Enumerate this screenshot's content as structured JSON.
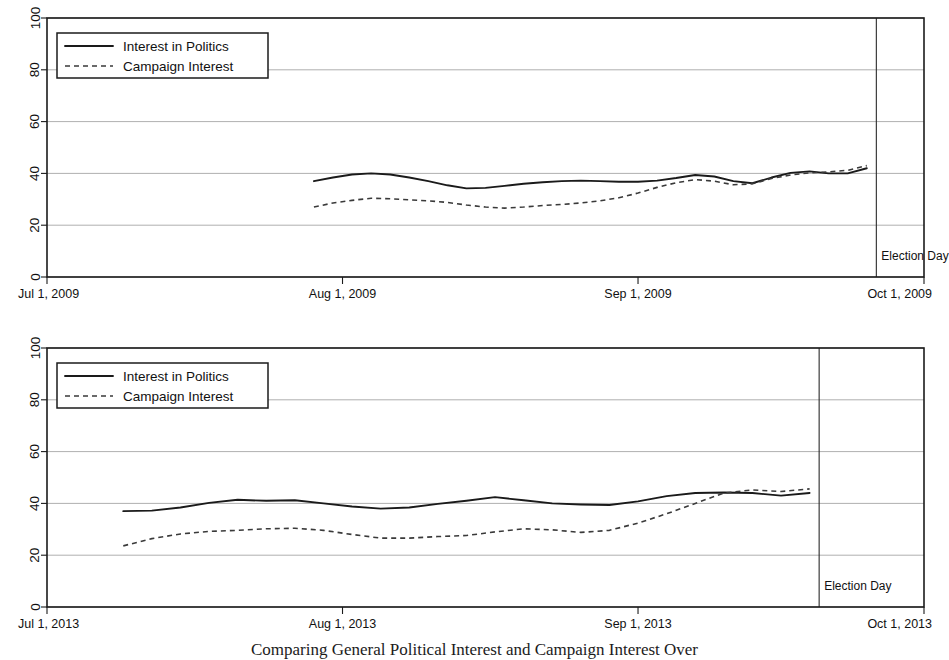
{
  "figure": {
    "caption": "Comparing General Political Interest and Campaign Interest Over"
  },
  "legend": {
    "entries": [
      {
        "label": "Interest in Politics",
        "style": "solid"
      },
      {
        "label": "Campaign Interest",
        "style": "dashed"
      }
    ]
  },
  "annotations": {
    "election_day": "Election Day"
  },
  "chart_data": [
    {
      "id": "panel-2009",
      "type": "line",
      "title": "",
      "xlabel": "",
      "ylabel": "",
      "ylim": [
        0,
        100
      ],
      "yticks": [
        0,
        20,
        40,
        60,
        80,
        100
      ],
      "ytick_labels": [
        "0",
        "20",
        "40",
        "60",
        "80",
        "100"
      ],
      "grid": true,
      "legend_position": "top-left",
      "xlim": [
        "Jul 1, 2009",
        "Oct 1, 2009"
      ],
      "xticks": [
        "Jul 1, 2009",
        "Aug 1, 2009",
        "Sep 1, 2009",
        "Oct 1, 2009"
      ],
      "xtick_days": [
        0,
        31,
        62,
        92
      ],
      "annotations": [
        {
          "text": "Election Day",
          "type": "vline",
          "day": 87
        }
      ],
      "series": [
        {
          "name": "Interest in Politics",
          "style": "solid",
          "x_days": [
            28,
            30,
            32,
            34,
            36,
            38,
            40,
            42,
            44,
            46,
            48,
            50,
            52,
            54,
            56,
            58,
            60,
            62,
            64,
            66,
            68,
            70,
            72,
            74,
            76,
            78,
            80,
            82,
            84,
            86
          ],
          "values": [
            37.0,
            38.4,
            39.6,
            40.0,
            39.6,
            38.4,
            37.0,
            35.4,
            34.2,
            34.4,
            35.2,
            36.0,
            36.6,
            37.0,
            37.2,
            37.0,
            36.8,
            36.8,
            37.2,
            38.2,
            39.4,
            38.8,
            37.0,
            36.2,
            38.4,
            40.2,
            40.8,
            40.0,
            40.0,
            42.0
          ]
        },
        {
          "name": "Campaign Interest",
          "style": "dashed",
          "x_days": [
            28,
            30,
            32,
            34,
            36,
            38,
            40,
            42,
            44,
            46,
            48,
            50,
            52,
            54,
            56,
            58,
            60,
            62,
            64,
            66,
            68,
            70,
            72,
            74,
            76,
            78,
            80,
            82,
            84,
            86
          ],
          "values": [
            27.0,
            28.6,
            29.6,
            30.4,
            30.2,
            29.8,
            29.4,
            28.8,
            27.8,
            27.0,
            26.6,
            27.0,
            27.6,
            28.0,
            28.6,
            29.4,
            30.6,
            32.4,
            34.6,
            36.4,
            37.6,
            37.0,
            35.6,
            36.0,
            38.0,
            39.4,
            40.2,
            40.6,
            41.2,
            43.0
          ]
        }
      ]
    },
    {
      "id": "panel-2013",
      "type": "line",
      "title": "",
      "xlabel": "",
      "ylabel": "",
      "ylim": [
        0,
        100
      ],
      "yticks": [
        0,
        20,
        40,
        60,
        80,
        100
      ],
      "ytick_labels": [
        "0",
        "20",
        "40",
        "60",
        "80",
        "100"
      ],
      "grid": true,
      "legend_position": "top-left",
      "xlim": [
        "Jul 1, 2013",
        "Oct 1, 2013"
      ],
      "xticks": [
        "Jul 1, 2013",
        "Aug 1, 2013",
        "Sep 1, 2013",
        "Oct 1, 2013"
      ],
      "xtick_days": [
        0,
        31,
        62,
        92
      ],
      "annotations": [
        {
          "text": "Election Day",
          "type": "vline",
          "day": 81
        }
      ],
      "series": [
        {
          "name": "Interest in Politics",
          "style": "solid",
          "x_days": [
            8,
            11,
            14,
            17,
            20,
            23,
            26,
            29,
            32,
            35,
            38,
            41,
            44,
            47,
            50,
            53,
            56,
            59,
            62,
            65,
            68,
            71,
            74,
            77,
            80
          ],
          "values": [
            37.0,
            37.2,
            38.4,
            40.2,
            41.4,
            41.0,
            41.2,
            40.0,
            38.8,
            38.0,
            38.4,
            39.8,
            41.0,
            42.4,
            41.2,
            40.0,
            39.6,
            39.4,
            40.8,
            42.8,
            44.0,
            44.2,
            44.0,
            43.0,
            44.0
          ]
        },
        {
          "name": "Campaign Interest",
          "style": "dashed",
          "x_days": [
            8,
            11,
            14,
            17,
            20,
            23,
            26,
            29,
            32,
            35,
            38,
            41,
            44,
            47,
            50,
            53,
            56,
            59,
            62,
            65,
            68,
            71,
            74,
            77,
            80
          ],
          "values": [
            23.6,
            26.4,
            28.2,
            29.2,
            29.6,
            30.2,
            30.4,
            29.6,
            28.0,
            26.6,
            26.6,
            27.2,
            27.6,
            29.0,
            30.2,
            29.8,
            28.8,
            29.6,
            32.4,
            36.0,
            40.0,
            44.0,
            45.2,
            44.6,
            45.6
          ]
        }
      ]
    }
  ]
}
